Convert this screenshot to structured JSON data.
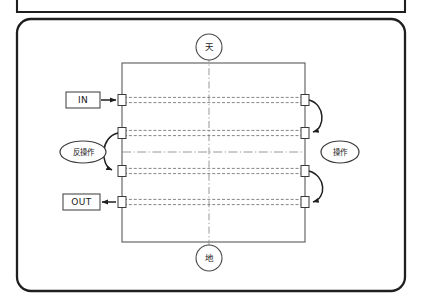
{
  "figure": {
    "kind": "technical-line-diagram",
    "background_color": "#ffffff",
    "line_color": "#222222",
    "faint_line_color": "#8a8a8a",
    "outer_frame": {
      "name": "rounded-outer-frame",
      "x": 17,
      "y": 19,
      "width": 388,
      "height": 272,
      "corner_radius": 14
    },
    "partial_frame_above": {
      "name": "cropped-frame-above",
      "x": 17,
      "y": -12,
      "width": 388,
      "height": 24
    },
    "inner_rect": {
      "name": "device-body-rectangle",
      "x": 122,
      "y": 63,
      "width": 183,
      "height": 179
    },
    "center_lines": {
      "vertical_x": 209,
      "vertical_top": 55,
      "vertical_bottom": 250,
      "horizontal_y": 152,
      "horizontal_left": 122,
      "horizontal_right": 305,
      "style": "dash-dot"
    },
    "traces": [
      {
        "name": "trace-1",
        "y": 100,
        "left_x": 122,
        "right_x": 305
      },
      {
        "name": "trace-2",
        "y": 133,
        "left_x": 122,
        "right_x": 305
      },
      {
        "name": "trace-3",
        "y": 171,
        "left_x": 122,
        "right_x": 305
      },
      {
        "name": "trace-4",
        "y": 202,
        "left_x": 122,
        "right_x": 305
      }
    ],
    "trace_pair_offset": 2.6,
    "pads": {
      "width": 8,
      "height": 11,
      "left_x": 118,
      "right_x": 301
    },
    "arcs": [
      {
        "name": "arc-right-upper",
        "from_trace": 1,
        "to_trace": 2,
        "side": "right",
        "arrow_at": "end"
      },
      {
        "name": "arc-left-middle",
        "from_trace": 2,
        "to_trace": 3,
        "side": "left",
        "arrow_at": "end"
      },
      {
        "name": "arc-right-lower",
        "from_trace": 3,
        "to_trace": 4,
        "side": "right",
        "arrow_at": "end"
      }
    ]
  },
  "labels": {
    "top_node": {
      "text": "天",
      "shape": "circle",
      "cx": 209,
      "cy": 47,
      "r": 13
    },
    "bottom_node": {
      "text": "地",
      "shape": "circle",
      "cx": 209,
      "cy": 258,
      "r": 13
    },
    "left_bubble": {
      "text": "反操作",
      "shape": "ellipse",
      "cx": 83,
      "cy": 152,
      "rx": 23,
      "ry": 11
    },
    "right_bubble": {
      "text": "操作",
      "shape": "ellipse",
      "cx": 340,
      "cy": 152,
      "rx": 19,
      "ry": 11
    },
    "in_box": {
      "text": "IN",
      "shape": "rect",
      "x": 66,
      "y": 92,
      "width": 34,
      "height": 16,
      "arrow_direction": "right",
      "arrow_from_x": 100,
      "arrow_to_x": 118,
      "arrow_y": 100
    },
    "out_box": {
      "text": "OUT",
      "shape": "rect",
      "x": 63,
      "y": 194,
      "width": 37,
      "height": 16,
      "arrow_direction": "left",
      "arrow_from_x": 118,
      "arrow_to_x": 100,
      "arrow_y": 202
    }
  }
}
